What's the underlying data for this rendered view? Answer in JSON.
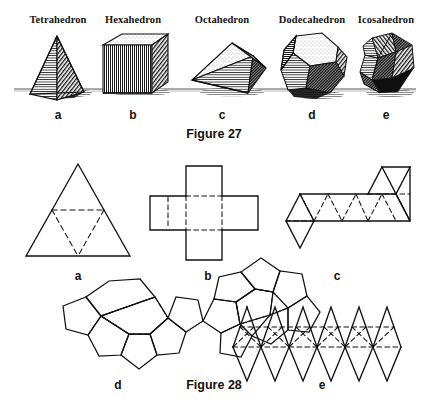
{
  "page": {
    "width": 429,
    "height": 415,
    "background": "#ffffff",
    "ink": "#111111"
  },
  "figure27": {
    "caption": "Figure 27",
    "caption_x": 214,
    "caption_y": 131,
    "ground_line_y": 89,
    "solids": [
      {
        "name": "Tetrahedron",
        "letter": "a",
        "label_x": 58,
        "label_y": 14,
        "letter_x": 58,
        "letter_y": 110,
        "cx": 58,
        "icon": "tetrahedron-solid-icon"
      },
      {
        "name": "Hexahedron",
        "letter": "b",
        "label_x": 133,
        "label_y": 14,
        "letter_x": 133,
        "letter_y": 110,
        "cx": 133,
        "icon": "hexahedron-solid-icon"
      },
      {
        "name": "Octahedron",
        "letter": "c",
        "label_x": 222,
        "label_y": 14,
        "letter_x": 222,
        "letter_y": 110,
        "cx": 222,
        "icon": "octahedron-solid-icon"
      },
      {
        "name": "Dodecahedron",
        "letter": "d",
        "label_x": 312,
        "label_y": 14,
        "letter_x": 312,
        "letter_y": 110,
        "cx": 312,
        "icon": "dodecahedron-solid-icon"
      },
      {
        "name": "Icosahedron",
        "letter": "e",
        "label_x": 386,
        "label_y": 14,
        "letter_x": 386,
        "letter_y": 110,
        "cx": 386,
        "icon": "icosahedron-solid-icon"
      }
    ]
  },
  "figure28": {
    "caption": "Figure 28",
    "caption_x": 214,
    "caption_y": 381,
    "nets": [
      {
        "letter": "a",
        "net_of": "Tetrahedron",
        "letter_x": 78,
        "letter_y": 272,
        "icon": "tetrahedron-net-icon"
      },
      {
        "letter": "b",
        "net_of": "Hexahedron",
        "letter_x": 208,
        "letter_y": 272,
        "icon": "hexahedron-net-icon"
      },
      {
        "letter": "c",
        "net_of": "Octahedron",
        "letter_x": 337,
        "letter_y": 272,
        "icon": "octahedron-net-icon"
      },
      {
        "letter": "d",
        "net_of": "Dodecahedron",
        "letter_x": 118,
        "letter_y": 381,
        "icon": "dodecahedron-net-icon"
      },
      {
        "letter": "e",
        "net_of": "Icosahedron",
        "letter_x": 322,
        "letter_y": 381,
        "icon": "icosahedron-net-icon"
      }
    ]
  }
}
